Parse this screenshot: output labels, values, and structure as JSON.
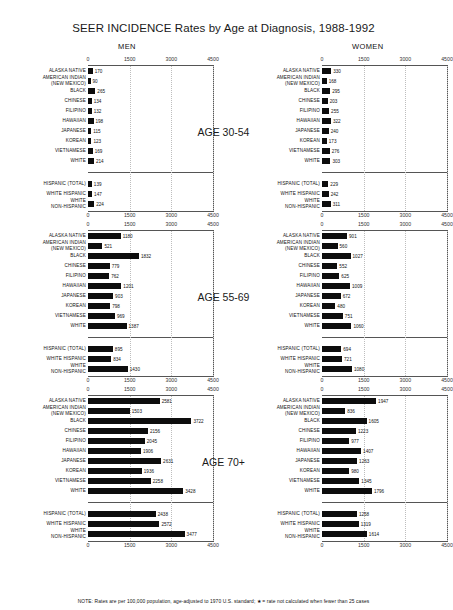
{
  "title": "SEER INCIDENCE Rates by Age at Diagnosis, 1988-1992",
  "headings": {
    "men": "MEN",
    "women": "WOMEN"
  },
  "note": "NOTE:  Rates are per 100,000 population, age-adjusted to 1970 U.S. standard;   ★ = rate not calculated when fewer than 25 cases",
  "axis": {
    "ticks": [
      "0",
      "1500",
      "3000",
      "4500"
    ],
    "min": 0,
    "max": 4500
  },
  "age_labels": [
    "AGE 30-54",
    "AGE 55-69",
    "AGE 70+"
  ],
  "categories_main": [
    "ALASKA NATIVE",
    "AMERICAN INDIAN\n(NEW MEXICO)",
    "BLACK",
    "CHINESE",
    "FILIPINO",
    "HAWAIIAN",
    "JAPANESE",
    "KOREAN",
    "VIETNAMESE",
    "WHITE"
  ],
  "categories_hispanic": [
    "HISPANIC (TOTAL)",
    "WHITE HISPANIC",
    "WHITE\nNON-HISPANIC"
  ],
  "chart_data": {
    "type": "bar",
    "title": "SEER INCIDENCE Rates by Age at Diagnosis, 1988-1992",
    "xlabel": "Rate per 100,000 population",
    "ylabel": "",
    "xlim": [
      0,
      4500
    ],
    "xticks": [
      0,
      1500,
      3000,
      4500
    ],
    "grid": "vertical-dotted",
    "legend": "none",
    "orientation": "horizontal",
    "panels": [
      {
        "age": "AGE 30-54",
        "sex": "MEN",
        "categories": [
          "ALASKA NATIVE",
          "AMERICAN INDIAN (NEW MEXICO)",
          "BLACK",
          "CHINESE",
          "FILIPINO",
          "HAWAIIAN",
          "JAPANESE",
          "KOREAN",
          "VIETNAMESE",
          "WHITE"
        ],
        "values": [
          170,
          90,
          265,
          134,
          132,
          198,
          115,
          123,
          169,
          214
        ],
        "hispanic_categories": [
          "HISPANIC (TOTAL)",
          "WHITE HISPANIC",
          "WHITE NON-HISPANIC"
        ],
        "hispanic_values": [
          139,
          147,
          224
        ]
      },
      {
        "age": "AGE 30-54",
        "sex": "WOMEN",
        "categories": [
          "ALASKA NATIVE",
          "AMERICAN INDIAN (NEW MEXICO)",
          "BLACK",
          "CHINESE",
          "FILIPINO",
          "HAWAIIAN",
          "JAPANESE",
          "KOREAN",
          "VIETNAMESE",
          "WHITE"
        ],
        "values": [
          330,
          168,
          295,
          203,
          255,
          322,
          240,
          173,
          276,
          303
        ],
        "hispanic_categories": [
          "HISPANIC (TOTAL)",
          "WHITE HISPANIC",
          "WHITE NON-HISPANIC"
        ],
        "hispanic_values": [
          229,
          242,
          311
        ]
      },
      {
        "age": "AGE 55-69",
        "sex": "MEN",
        "categories": [
          "ALASKA NATIVE",
          "AMERICAN INDIAN (NEW MEXICO)",
          "BLACK",
          "CHINESE",
          "FILIPINO",
          "HAWAIIAN",
          "JAPANESE",
          "KOREAN",
          "VIETNAMESE",
          "WHITE"
        ],
        "values": [
          1180,
          521,
          1832,
          779,
          762,
          1201,
          903,
          798,
          969,
          1387
        ],
        "hispanic_categories": [
          "HISPANIC (TOTAL)",
          "WHITE HISPANIC",
          "WHITE NON-HISPANIC"
        ],
        "hispanic_values": [
          895,
          834,
          1430
        ]
      },
      {
        "age": "AGE 55-69",
        "sex": "WOMEN",
        "categories": [
          "ALASKA NATIVE",
          "AMERICAN INDIAN (NEW MEXICO)",
          "BLACK",
          "CHINESE",
          "FILIPINO",
          "HAWAIIAN",
          "JAPANESE",
          "KOREAN",
          "VIETNAMESE",
          "WHITE"
        ],
        "values": [
          901,
          560,
          1027,
          552,
          625,
          1009,
          672,
          480,
          751,
          1060
        ],
        "hispanic_categories": [
          "HISPANIC (TOTAL)",
          "WHITE HISPANIC",
          "WHITE NON-HISPANIC"
        ],
        "hispanic_values": [
          694,
          721,
          1080
        ]
      },
      {
        "age": "AGE 70+",
        "sex": "MEN",
        "categories": [
          "ALASKA NATIVE",
          "AMERICAN INDIAN (NEW MEXICO)",
          "BLACK",
          "CHINESE",
          "FILIPINO",
          "HAWAIIAN",
          "JAPANESE",
          "KOREAN",
          "VIETNAMESE",
          "WHITE"
        ],
        "values": [
          2581,
          1503,
          3722,
          2156,
          2045,
          1906,
          2631,
          1936,
          2258,
          3428
        ],
        "hispanic_categories": [
          "HISPANIC (TOTAL)",
          "WHITE HISPANIC",
          "WHITE NON-HISPANIC"
        ],
        "hispanic_values": [
          2438,
          2572,
          3477
        ]
      },
      {
        "age": "AGE 70+",
        "sex": "WOMEN",
        "categories": [
          "ALASKA NATIVE",
          "AMERICAN INDIAN (NEW MEXICO)",
          "BLACK",
          "CHINESE",
          "FILIPINO",
          "HAWAIIAN",
          "JAPANESE",
          "KOREAN",
          "VIETNAMESE",
          "WHITE"
        ],
        "values": [
          1947,
          836,
          1605,
          1223,
          977,
          1407,
          1263,
          980,
          1345,
          1796
        ],
        "hispanic_categories": [
          "HISPANIC (TOTAL)",
          "WHITE HISPANIC",
          "WHITE NON-HISPANIC"
        ],
        "hispanic_values": [
          1258,
          1319,
          1614
        ]
      }
    ]
  }
}
